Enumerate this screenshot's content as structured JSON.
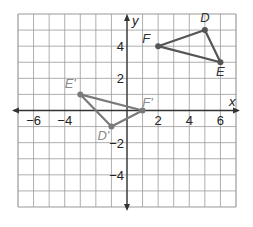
{
  "grid": {
    "xmin": -7,
    "xmax": 7,
    "ymin": -6,
    "ymax": 6,
    "left": 18,
    "right": 236,
    "top": 14,
    "bottom": 207,
    "grid_color": "#9a9a9a",
    "axis_color": "#333333"
  },
  "axes": {
    "x_label": "x",
    "y_label": "y",
    "x_ticks": [
      {
        "value": -6,
        "label": "−6"
      },
      {
        "value": -4,
        "label": "−4"
      },
      {
        "value": 2,
        "label": "2"
      },
      {
        "value": 4,
        "label": "4"
      },
      {
        "value": 6,
        "label": "6"
      }
    ],
    "y_ticks": [
      {
        "value": 4,
        "label": "4"
      },
      {
        "value": 2,
        "label": "2"
      },
      {
        "value": -2,
        "label": "−2"
      },
      {
        "value": -4,
        "label": "−4"
      }
    ]
  },
  "triangles": [
    {
      "name": "DEF",
      "color": "#555555",
      "label_color": "#333333",
      "vertices": [
        {
          "label": "D",
          "x": 5,
          "y": 5,
          "dx": 0,
          "dy": -8
        },
        {
          "label": "E",
          "x": 6,
          "y": 3,
          "dx": 0,
          "dy": 14
        },
        {
          "label": "F",
          "x": 2,
          "y": 4,
          "dx": -12,
          "dy": -3
        }
      ]
    },
    {
      "name": "D'E'F'",
      "color": "#7a7a7a",
      "label_color": "#8a8a8a",
      "vertices": [
        {
          "label": "D'",
          "x": -1,
          "y": -1,
          "dx": -8,
          "dy": 13
        },
        {
          "label": "E'",
          "x": -3,
          "y": 1,
          "dx": -10,
          "dy": -6
        },
        {
          "label": "F'",
          "x": 1,
          "y": 0,
          "dx": 5,
          "dy": -4
        }
      ]
    }
  ],
  "chart_data": {
    "type": "scatter",
    "title": "",
    "xlabel": "x",
    "ylabel": "y",
    "xlim": [
      -7,
      7
    ],
    "ylim": [
      -6,
      6
    ],
    "grid": true,
    "series": [
      {
        "name": "Triangle DEF",
        "points": [
          {
            "label": "D",
            "x": 5,
            "y": 5
          },
          {
            "label": "E",
            "x": 6,
            "y": 3
          },
          {
            "label": "F",
            "x": 2,
            "y": 4
          }
        ]
      },
      {
        "name": "Triangle D'E'F'",
        "points": [
          {
            "label": "D'",
            "x": -1,
            "y": -1
          },
          {
            "label": "E'",
            "x": -3,
            "y": 1
          },
          {
            "label": "F'",
            "x": 1,
            "y": 0
          }
        ]
      }
    ]
  }
}
